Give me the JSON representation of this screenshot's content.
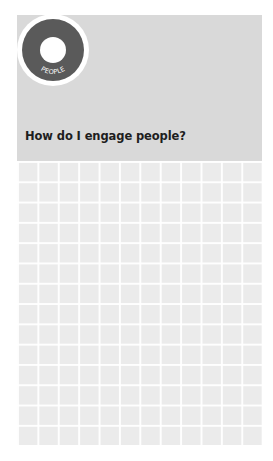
{
  "header": {
    "badge_label": "PEOPLE",
    "title": "How do I engage people?"
  },
  "colors": {
    "panel": "#d9d9d9",
    "badge_ring": "#5a5a5a",
    "grid_bg": "#ebebeb",
    "grid_lines": "#ffffff"
  },
  "grid": {
    "columns": 12,
    "rows": 14
  }
}
